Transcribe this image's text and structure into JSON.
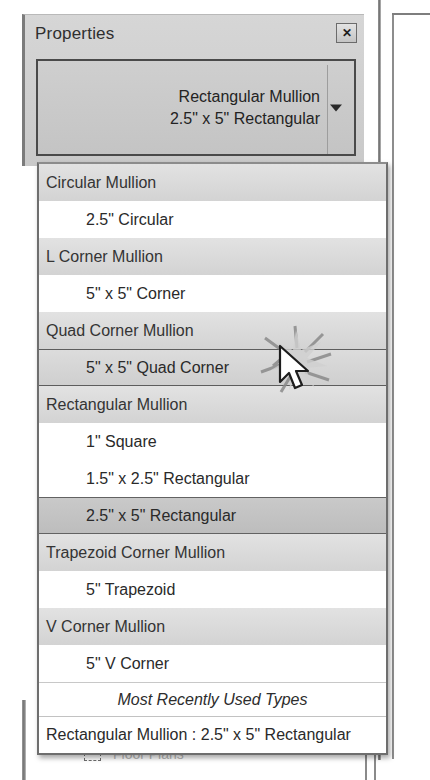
{
  "palette": {
    "title": "Properties",
    "close_icon": "close-icon",
    "close_glyph": "✕",
    "type_selector": {
      "family": "Rectangular Mullion",
      "type": "2.5\" x 5\" Rectangular",
      "arrow_icon": "chevron-down-icon"
    }
  },
  "dropdown": {
    "rows": [
      {
        "kind": "group",
        "label": "Circular Mullion"
      },
      {
        "kind": "item",
        "label": "2.5\" Circular",
        "state": "normal"
      },
      {
        "kind": "group",
        "label": "L Corner Mullion"
      },
      {
        "kind": "item",
        "label": "5\" x 5\" Corner",
        "state": "normal"
      },
      {
        "kind": "group",
        "label": "Quad Corner Mullion"
      },
      {
        "kind": "item",
        "label": "5\" x 5\" Quad Corner",
        "state": "hovered"
      },
      {
        "kind": "group",
        "label": "Rectangular Mullion"
      },
      {
        "kind": "item",
        "label": "1\" Square",
        "state": "normal"
      },
      {
        "kind": "item",
        "label": "1.5\" x 2.5\" Rectangular",
        "state": "normal"
      },
      {
        "kind": "item",
        "label": "2.5\" x 5\" Rectangular",
        "state": "selected"
      },
      {
        "kind": "group",
        "label": "Trapezoid Corner Mullion"
      },
      {
        "kind": "item",
        "label": "5\" Trapezoid",
        "state": "normal"
      },
      {
        "kind": "group",
        "label": "V Corner Mullion"
      },
      {
        "kind": "item",
        "label": "5\" V Corner",
        "state": "normal"
      }
    ],
    "mru_header": "Most Recently Used Types",
    "mru_items": [
      "Rectangular Mullion : 2.5\" x 5\" Rectangular"
    ]
  },
  "project_browser": {
    "rows": [
      {
        "label": "Views (all)",
        "indent": 0,
        "faded": false
      },
      {
        "label": "Floor Plans",
        "indent": 1,
        "faded": true
      }
    ]
  },
  "colors": {
    "group_row": "#DADADA",
    "item_row": "#FFFFFF",
    "selected_row": "#C3C3C3",
    "hovered_row": "#D5D5D5",
    "palette_bg": "#CFCFCF",
    "border": "#6E6E6E",
    "text": "#2A2A2A"
  }
}
